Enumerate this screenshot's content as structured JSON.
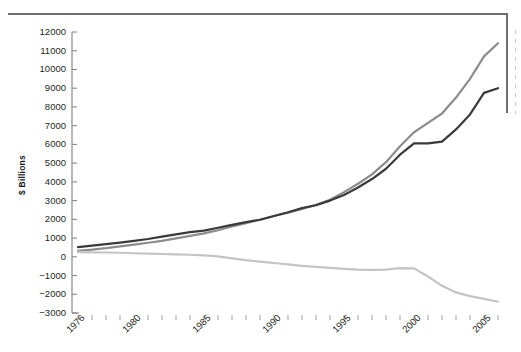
{
  "chart_data": {
    "type": "line",
    "title": "",
    "subtitle": "",
    "xlabel": "",
    "ylabel": "$ Billions",
    "grid": false,
    "legend_position": "none",
    "xlim": [
      1976,
      2006
    ],
    "ylim": [
      -3000,
      12000
    ],
    "yticks": [
      12000,
      11000,
      10000,
      9000,
      8000,
      7000,
      6000,
      5000,
      4000,
      3000,
      2000,
      1000,
      0,
      -1000,
      -2000,
      -3000
    ],
    "ytick_labels": [
      "12000",
      "11000",
      "10000",
      "9000",
      "8000",
      "7000",
      "6000",
      "5000",
      "4000",
      "3000",
      "2000",
      "1000",
      "0",
      "−1000",
      "−2000",
      "−3000"
    ],
    "xticks": [
      1976,
      1977,
      1978,
      1979,
      1980,
      1981,
      1982,
      1983,
      1984,
      1985,
      1986,
      1987,
      1988,
      1989,
      1990,
      1991,
      1992,
      1993,
      1994,
      1995,
      1996,
      1997,
      1998,
      1999,
      2000,
      2001,
      2002,
      2003,
      2004,
      2005,
      2006
    ],
    "xtick_labels": [
      "1976",
      "",
      "",
      "",
      "1980",
      "",
      "",
      "",
      "",
      "1985",
      "",
      "",
      "",
      "",
      "1990",
      "",
      "",
      "",
      "",
      "1995",
      "",
      "",
      "",
      "",
      "2000",
      "",
      "",
      "",
      "",
      "2005",
      ""
    ],
    "x": [
      1976,
      1977,
      1978,
      1979,
      1980,
      1981,
      1982,
      1983,
      1984,
      1985,
      1986,
      1987,
      1988,
      1989,
      1990,
      1991,
      1992,
      1993,
      1994,
      1995,
      1996,
      1997,
      1998,
      1999,
      2000,
      2001,
      2002,
      2003,
      2004,
      2005,
      2006
    ],
    "series": [
      {
        "name": "series-medium-gray",
        "color": "#8c8c8c",
        "linewidth": 2.2,
        "values": [
          320,
          380,
          460,
          560,
          650,
          750,
          850,
          980,
          1120,
          1250,
          1420,
          1620,
          1800,
          1980,
          2180,
          2350,
          2550,
          2780,
          3050,
          3450,
          3900,
          4400,
          5050,
          5900,
          6650,
          7150,
          7650,
          8500,
          9500,
          10700,
          11400
        ]
      },
      {
        "name": "series-dark-gray",
        "color": "#3a3a3a",
        "linewidth": 2.2,
        "values": [
          520,
          600,
          680,
          760,
          850,
          950,
          1080,
          1200,
          1320,
          1400,
          1550,
          1700,
          1850,
          1980,
          2180,
          2380,
          2600,
          2750,
          3000,
          3300,
          3700,
          4150,
          4700,
          5450,
          6050,
          6050,
          6150,
          6800,
          7600,
          8750,
          9000
        ]
      },
      {
        "name": "series-light-gray",
        "color": "#c4c4c4",
        "linewidth": 2.2,
        "values": [
          250,
          240,
          230,
          215,
          190,
          170,
          150,
          130,
          110,
          80,
          20,
          -80,
          -180,
          -260,
          -330,
          -400,
          -480,
          -540,
          -590,
          -640,
          -680,
          -700,
          -680,
          -600,
          -620,
          -1050,
          -1550,
          -1900,
          -2100,
          -2250,
          -2400
        ]
      }
    ]
  }
}
